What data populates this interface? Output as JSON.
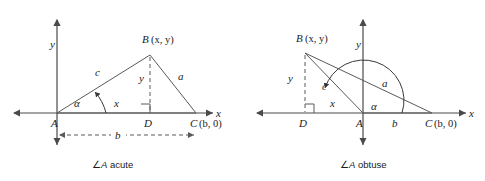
{
  "figure": {
    "panels": [
      {
        "id": "acute",
        "caption_symbol": "∠",
        "caption_italic": "A",
        "caption_text": " acute",
        "axis_labels": {
          "x": "x",
          "y": "y"
        },
        "vertices": [
          {
            "name": "A",
            "label": "A",
            "coord_label": ""
          },
          {
            "name": "B",
            "label": "B",
            "coord_label": "(x, y)"
          },
          {
            "name": "C",
            "label": "C",
            "coord_label": "(b, 0)"
          },
          {
            "name": "D",
            "label": "D",
            "coord_label": ""
          }
        ],
        "side_labels": {
          "c": "c",
          "a": "a",
          "x": "x",
          "y": "y",
          "b": "b"
        },
        "angle_label": "α",
        "right_angle_at": "D"
      },
      {
        "id": "obtuse",
        "caption_symbol": "∠",
        "caption_italic": "A",
        "caption_text": " obtuse",
        "axis_labels": {
          "x": "x",
          "y": "y"
        },
        "vertices": [
          {
            "name": "A",
            "label": "A",
            "coord_label": ""
          },
          {
            "name": "B",
            "label": "B",
            "coord_label": "(x, y)"
          },
          {
            "name": "C",
            "label": "C",
            "coord_label": "(b, 0)"
          },
          {
            "name": "D",
            "label": "D",
            "coord_label": ""
          }
        ],
        "side_labels": {
          "c": "c",
          "a": "a",
          "x": "x",
          "y": "y",
          "b": "b"
        },
        "angle_label": "α",
        "right_angle_at": "D"
      }
    ],
    "colors": {
      "axis": "#4a4a4a",
      "triangle": "#5a5a5a",
      "text": "#1a1a1a",
      "background": "#ffffff"
    }
  }
}
